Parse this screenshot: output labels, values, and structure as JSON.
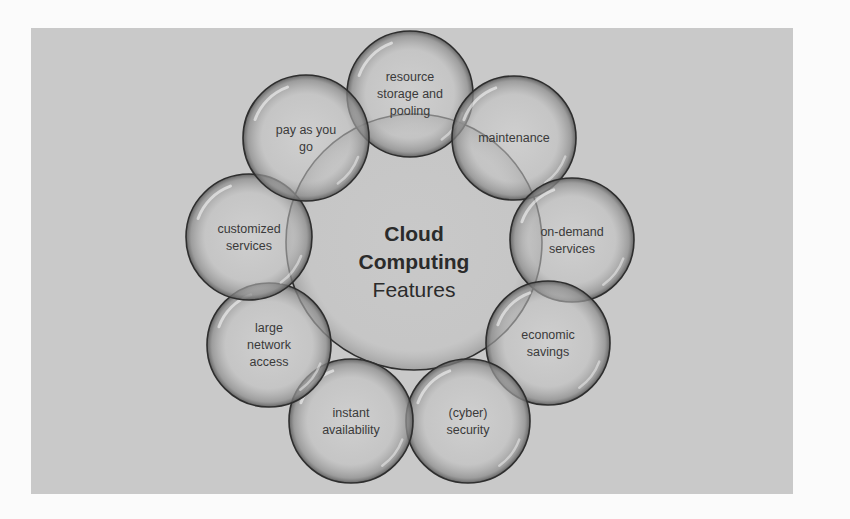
{
  "diagram": {
    "center": {
      "title_line1": "Cloud",
      "title_line2": "Computing",
      "subtitle": "Features"
    },
    "features": [
      {
        "id": "resource-storage-pooling",
        "lines": [
          "resource",
          "storage and",
          "pooling"
        ]
      },
      {
        "id": "maintenance",
        "lines": [
          "maintenance"
        ]
      },
      {
        "id": "on-demand-services",
        "lines": [
          "on-demand",
          "services"
        ]
      },
      {
        "id": "economic-savings",
        "lines": [
          "economic",
          "savings"
        ]
      },
      {
        "id": "cyber-security",
        "lines": [
          "(cyber)",
          "security"
        ]
      },
      {
        "id": "instant-availability",
        "lines": [
          "instant",
          "availability"
        ]
      },
      {
        "id": "large-network-access",
        "lines": [
          "large",
          "network",
          "access"
        ]
      },
      {
        "id": "customized-services",
        "lines": [
          "customized",
          "services"
        ]
      },
      {
        "id": "pay-as-you-go",
        "lines": [
          "pay as you",
          "go"
        ]
      }
    ],
    "colors": {
      "panel": "#c9c9c9",
      "bubble_stroke": "#2e2e2e",
      "bubble_fill": "#bdbdbd",
      "text": "#3a3a3a"
    }
  }
}
